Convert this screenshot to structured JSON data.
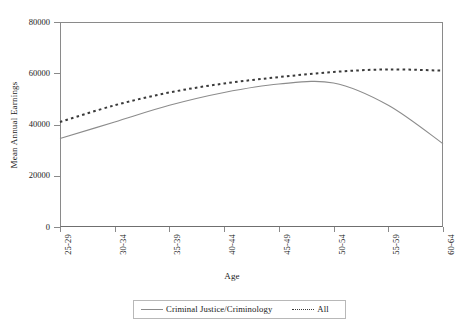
{
  "chart_data": {
    "type": "line",
    "title": "",
    "xlabel": "Age",
    "ylabel": "Mean Annual Earnings",
    "categories": [
      "25-29",
      "30-34",
      "35-39",
      "40-44",
      "45-49",
      "50-54",
      "55-59",
      "60-64"
    ],
    "ylim": [
      0,
      80000
    ],
    "yticks": [
      0,
      20000,
      40000,
      60000,
      80000
    ],
    "ytick_labels": [
      "0",
      "20000",
      "40000",
      "60000",
      "80000"
    ],
    "grid": false,
    "legend_position": "bottom",
    "series": [
      {
        "name": "Criminal Justice/Criminology",
        "style": "solid",
        "color": "#8c8c8c",
        "values": [
          34500,
          41000,
          47500,
          52500,
          55800,
          56200,
          47500,
          32500
        ]
      },
      {
        "name": "All",
        "style": "dotted",
        "color": "#3a3a3a",
        "values": [
          41000,
          47500,
          52500,
          56000,
          58500,
          60500,
          61500,
          61000
        ]
      }
    ]
  },
  "axes": {
    "y_title": "Mean Annual Earnings",
    "x_title": "Age"
  },
  "legend": {
    "items": [
      {
        "label": "Criminal Justice/Criminology",
        "style": "solid"
      },
      {
        "label": "All",
        "style": "dotted"
      }
    ]
  },
  "colors": {
    "series_solid": "#8c8c8c",
    "series_dotted": "#3a3a3a",
    "axis": "#8a8a8a",
    "background": "#ffffff"
  }
}
